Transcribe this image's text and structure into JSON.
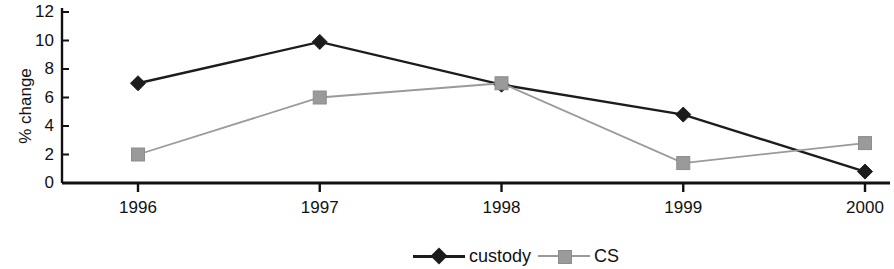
{
  "chart_data": {
    "type": "line",
    "title": "",
    "subtitle": "",
    "xlabel": "",
    "ylabel": "% change",
    "categories": [
      "1996",
      "1997",
      "1998",
      "1999",
      "2000"
    ],
    "x": [
      1996,
      1997,
      1998,
      1999,
      2000
    ],
    "series": [
      {
        "name": "custody",
        "values": [
          7.0,
          9.9,
          6.9,
          4.8,
          0.8
        ],
        "color": "#1c1c1c",
        "marker": "diamond"
      },
      {
        "name": "CS",
        "values": [
          2.0,
          6.0,
          7.0,
          1.4,
          2.8
        ],
        "color": "#9a9a9a",
        "marker": "square"
      }
    ],
    "ylim": [
      0,
      12
    ],
    "ytick_values": [
      0,
      2,
      4,
      6,
      8,
      10,
      12
    ],
    "ytick_labels": [
      "0",
      "2",
      "4",
      "6",
      "8",
      "10",
      "12"
    ],
    "grid": false,
    "legend_position": "bottom"
  },
  "axes": {
    "y_title": "% change"
  },
  "legend": {
    "items": [
      {
        "label": "custody",
        "color": "#1c1c1c",
        "marker": "diamond-marker"
      },
      {
        "label": "CS",
        "color": "#9a9a9a",
        "marker": "square-marker"
      }
    ]
  }
}
